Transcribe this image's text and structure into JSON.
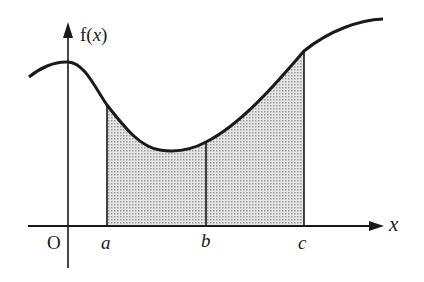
{
  "diagram": {
    "y_axis_label_prefix": "f(",
    "y_axis_label_var": "x",
    "y_axis_label_suffix": ")",
    "x_axis_label": "x",
    "origin_label": "O",
    "points": [
      {
        "label": "a"
      },
      {
        "label": "b"
      },
      {
        "label": "c"
      }
    ],
    "colors": {
      "stroke": "#1a1a1a",
      "shade": "#cfcfcf"
    }
  }
}
